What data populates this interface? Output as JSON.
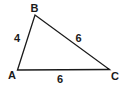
{
  "diagram": {
    "type": "triangle",
    "vertices": {
      "A": {
        "label": "A",
        "x": 17.5,
        "y": 70
      },
      "B": {
        "label": "B",
        "x": 35,
        "y": 15
      },
      "C": {
        "label": "C",
        "x": 109.5,
        "y": 69.5
      }
    },
    "sides": {
      "AB": {
        "label": "4"
      },
      "BC": {
        "label": "6"
      },
      "AC": {
        "label": "6"
      }
    },
    "stroke_color": "#1a1a1a",
    "background": "#ffffff"
  }
}
